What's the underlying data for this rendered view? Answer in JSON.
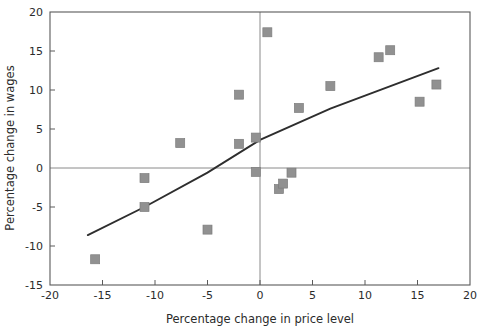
{
  "chart_data": {
    "type": "scatter",
    "title": "",
    "xlabel": "Percentage change in price level",
    "ylabel": "Percentage change in wages",
    "xlim": [
      -20,
      20
    ],
    "ylim": [
      -15,
      20
    ],
    "xticks": [
      -20,
      -15,
      -10,
      -5,
      0,
      5,
      10,
      15,
      20
    ],
    "yticks": [
      -15,
      -10,
      -5,
      0,
      5,
      10,
      15,
      20
    ],
    "xticklabels": [
      "-20",
      "-15",
      "-10",
      "-5",
      "0",
      "5",
      "10",
      "15",
      "20"
    ],
    "yticklabels": [
      "-15",
      "-10",
      "-5",
      "0",
      "5",
      "10",
      "15",
      "20"
    ],
    "grid": false,
    "legend": null,
    "marker_style": "square",
    "marker_color": "#919191",
    "trendline_color": "#2e2e2e",
    "zero_lines": {
      "x": 0,
      "y": 0,
      "color": "#8a8a8a"
    },
    "series": [
      {
        "name": "Price level vs wages",
        "points": [
          {
            "x": -15.7,
            "y": -11.7
          },
          {
            "x": -11.0,
            "y": -1.3
          },
          {
            "x": -11.0,
            "y": -5.0
          },
          {
            "x": -7.6,
            "y": 3.2
          },
          {
            "x": -5.0,
            "y": -7.9
          },
          {
            "x": -2.0,
            "y": 9.4
          },
          {
            "x": -2.0,
            "y": 3.1
          },
          {
            "x": -0.4,
            "y": 3.9
          },
          {
            "x": -0.4,
            "y": -0.5
          },
          {
            "x": 0.7,
            "y": 17.4
          },
          {
            "x": 1.8,
            "y": -2.7
          },
          {
            "x": 2.2,
            "y": -2.0
          },
          {
            "x": 3.0,
            "y": -0.6
          },
          {
            "x": 3.7,
            "y": 7.7
          },
          {
            "x": 6.7,
            "y": 10.5
          },
          {
            "x": 11.3,
            "y": 14.2
          },
          {
            "x": 12.4,
            "y": 15.1
          },
          {
            "x": 15.2,
            "y": 8.5
          },
          {
            "x": 16.8,
            "y": 10.7
          }
        ]
      }
    ],
    "trendline": {
      "name": "fitted trend",
      "points": [
        {
          "x": -16.4,
          "y": -8.6
        },
        {
          "x": -11.0,
          "y": -5.0
        },
        {
          "x": -5.0,
          "y": -0.6
        },
        {
          "x": 0.0,
          "y": 3.6
        },
        {
          "x": 6.7,
          "y": 7.6
        },
        {
          "x": 17.0,
          "y": 12.8
        }
      ]
    }
  }
}
